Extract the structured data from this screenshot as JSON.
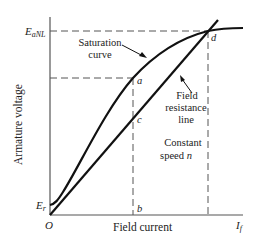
{
  "diagram": {
    "axes": {
      "x_label": "Field current",
      "y_label": "Armature voltage",
      "origin_label": "O",
      "x_end_label_main": "I",
      "x_end_label_sub": "f"
    },
    "y_markers": {
      "eanl_main": "E",
      "eanl_sub": "aNL",
      "er_main": "E",
      "er_sub": "r"
    },
    "points": {
      "a": "a",
      "b": "b",
      "c": "c",
      "d": "d"
    },
    "annotations": {
      "saturation_line1": "Saturation",
      "saturation_line2": "curve",
      "field_line1": "Field",
      "field_line2": "resistance",
      "field_line3": "line",
      "speed_line1": "Constant",
      "speed_line2_text": "speed ",
      "speed_line2_var": "n"
    },
    "colors": {
      "curve": "#111111",
      "axis": "#555555",
      "dash": "#555555",
      "text": "#222222"
    }
  }
}
